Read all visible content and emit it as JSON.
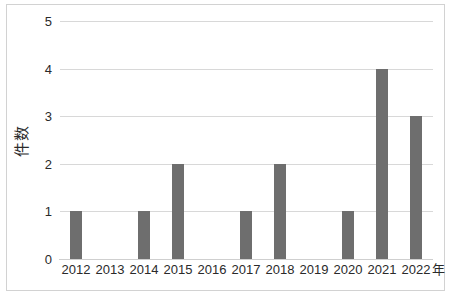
{
  "chart_data": {
    "type": "bar",
    "title": "",
    "subtitle": "",
    "xlabel": "年",
    "ylabel": "件数",
    "categories": [
      "2012",
      "2013",
      "2014",
      "2015",
      "2016",
      "2017",
      "2018",
      "2019",
      "2020",
      "2021",
      "2022"
    ],
    "values": [
      1,
      0,
      1,
      2,
      0,
      1,
      2,
      0,
      1,
      4,
      3
    ],
    "series": [
      {
        "name": "件数",
        "values": [
          1,
          0,
          1,
          2,
          0,
          1,
          2,
          0,
          1,
          4,
          3
        ]
      }
    ],
    "ylim": [
      0,
      5
    ],
    "y_ticks": [
      "0",
      "1",
      "2",
      "3",
      "4",
      "5"
    ],
    "x_tick_labels": [
      "2012",
      "2013",
      "2014",
      "2015",
      "2016",
      "2017",
      "2018",
      "2019",
      "2020",
      "2021",
      "2022"
    ],
    "x_axis_unit_label": "年",
    "grid": true,
    "grid_axis": "y",
    "legend": false,
    "legend_position": "none",
    "annotations": [],
    "colors": {
      "bar": "#6e6e6e",
      "gridline": "#d8d8d8",
      "baseline": "#cfcfcf",
      "frame_border": "#d2d2d2",
      "text": "#2a2a2a",
      "plot_background": "#ffffff"
    }
  }
}
